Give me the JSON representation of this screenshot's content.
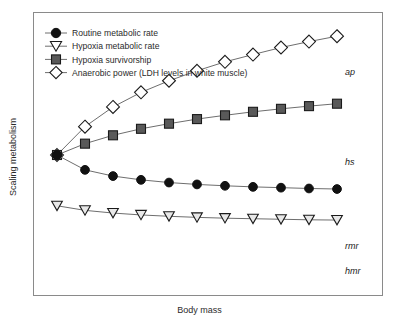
{
  "figure": {
    "background": "#ffffff",
    "frame_color": "#8a8a8a",
    "line_color": "#6e6e6e"
  },
  "axes": {
    "xlabel": "Body mass",
    "ylabel": "Scaling metabolism",
    "x_ticks": [],
    "y_ticks": [],
    "grid": false
  },
  "legend": {
    "position": "top-left-inside",
    "items": [
      {
        "label": "Routine metabolic rate",
        "marker": "circle-filled-icon",
        "color": "#111111",
        "key": "rmr"
      },
      {
        "label": "Hypoxia metabolic rate",
        "marker": "triangle-down-open-icon",
        "color": "#ffffff",
        "key": "hmr"
      },
      {
        "label": "Hypoxia survivorship",
        "marker": "square-filled-icon",
        "color": "#595959",
        "key": "hs"
      },
      {
        "label": "Anaerobic power (LDH levels in white muscle)",
        "marker": "diamond-open-icon",
        "color": "#ffffff",
        "key": "ap"
      }
    ]
  },
  "series_labels": {
    "ap": "ap",
    "hs": "hs",
    "rmr": "rmr",
    "hmr": "hmr"
  },
  "chart_data": {
    "type": "line",
    "title": "",
    "xlabel": "Body mass",
    "ylabel": "Scaling metabolism",
    "grid": false,
    "xlim": [
      0,
      10
    ],
    "ylim": [
      0,
      10
    ],
    "x": [
      0,
      1,
      2,
      3,
      4,
      5,
      6,
      7,
      8,
      9,
      10
    ],
    "series": [
      {
        "name": "Anaerobic power (LDH levels in white muscle)",
        "abbr": "ap",
        "marker": "diamond-open-icon",
        "marker_fill": "#ffffff",
        "marker_edge": "#1a1a1a",
        "values": [
          5.0,
          6.05,
          6.78,
          7.32,
          7.75,
          8.12,
          8.45,
          8.72,
          8.98,
          9.2,
          9.4
        ]
      },
      {
        "name": "Hypoxia survivorship",
        "abbr": "hs",
        "marker": "square-filled-icon",
        "marker_fill": "#595959",
        "marker_edge": "#1a1a1a",
        "values": [
          5.0,
          5.42,
          5.73,
          5.97,
          6.16,
          6.33,
          6.47,
          6.6,
          6.71,
          6.81,
          6.9
        ]
      },
      {
        "name": "Routine metabolic rate",
        "abbr": "rmr",
        "marker": "circle-filled-icon",
        "marker_fill": "#111111",
        "marker_edge": "#111111",
        "values": [
          5.0,
          4.45,
          4.22,
          4.08,
          3.98,
          3.91,
          3.86,
          3.82,
          3.79,
          3.76,
          3.74
        ]
      },
      {
        "name": "Hypoxia metabolic rate",
        "abbr": "hmr",
        "marker": "triangle-down-open-icon",
        "marker_fill": "#e8e8e8",
        "marker_edge": "#1a1a1a",
        "values": [
          3.12,
          2.95,
          2.85,
          2.78,
          2.73,
          2.69,
          2.66,
          2.64,
          2.62,
          2.6,
          2.59
        ]
      }
    ]
  }
}
